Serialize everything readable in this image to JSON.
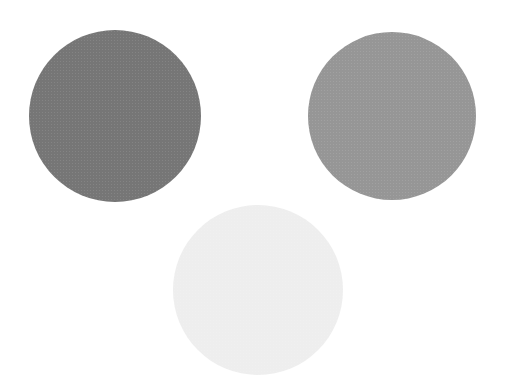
{
  "scene": {
    "background": "#ffffff",
    "circles": [
      {
        "name": "dark-gray-circle",
        "color": "#7a7a7a",
        "cx": 115,
        "cy": 116,
        "r": 86
      },
      {
        "name": "medium-gray-circle",
        "color": "#9c9c9c",
        "cx": 392,
        "cy": 116,
        "r": 84
      },
      {
        "name": "near-white-circle",
        "color": "#f7f7f7",
        "cx": 258,
        "cy": 290,
        "r": 85
      }
    ]
  }
}
